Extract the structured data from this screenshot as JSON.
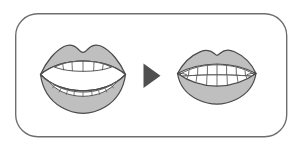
{
  "figure": {
    "title": "Mouth open to mouth closed transition",
    "background_color": "#ffffff"
  },
  "frame": {
    "name": "rounded-rectangle-border",
    "x": 15,
    "y": 13,
    "width": 272,
    "height": 124,
    "corner_radius": 22,
    "stroke_color": "#6e6e6e",
    "stroke_width": 1.4,
    "fill_color": "#ffffff"
  },
  "panels": [
    {
      "id": "open-mouth",
      "label": "Open mouth",
      "position": "left",
      "state": "open",
      "upper_teeth_count": 6,
      "lower_teeth_count": 11,
      "center_x": 83,
      "center_y": 75
    },
    {
      "id": "closed-mouth",
      "label": "Closed smiling mouth",
      "position": "right",
      "state": "closed",
      "upper_teeth_count": 7,
      "lower_teeth_count": 8,
      "center_x": 216,
      "center_y": 74
    }
  ],
  "arrow": {
    "name": "play-triangle-arrow",
    "direction": "right",
    "fill_color": "#4f4f4f",
    "x": 143,
    "y": 63,
    "width": 17,
    "height": 25
  },
  "colors": {
    "lip_fill": "#bfbfbf",
    "lip_stroke": "#4a4a4a",
    "tooth_fill": "#ffffff",
    "tooth_stroke": "#5a5a5a",
    "mouth_interior": "#ffffff",
    "interior_stroke": "#4a4a4a",
    "arrow": "#4f4f4f",
    "border": "#6e6e6e",
    "background": "#ffffff"
  }
}
